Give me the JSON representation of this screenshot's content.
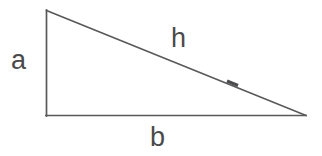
{
  "figure": {
    "background_color": "#ffffff",
    "line_color": "#59595c",
    "label_color": "#4a4a4a",
    "line_width": 1.6,
    "width": 322,
    "height": 156
  },
  "geometry": {
    "vertices": {
      "top_left": {
        "x": 46,
        "y": 10
      },
      "bottom_left": {
        "x": 46,
        "y": 116
      },
      "bottom_right": {
        "x": 306,
        "y": 116
      }
    },
    "sides": {
      "vertical_leg": {
        "label": "a",
        "from": "top_left",
        "to": "bottom_left"
      },
      "horizontal_leg": {
        "label": "b",
        "from": "bottom_left",
        "to": "bottom_right"
      },
      "hypotenuse": {
        "label": "h",
        "from": "top_left",
        "to": "bottom_right"
      }
    },
    "hypotenuse_tick": {
      "x": 232,
      "y": 83
    }
  },
  "labels": {
    "leg_vertical": "a",
    "leg_horizontal": "b",
    "hypotenuse": "h"
  }
}
